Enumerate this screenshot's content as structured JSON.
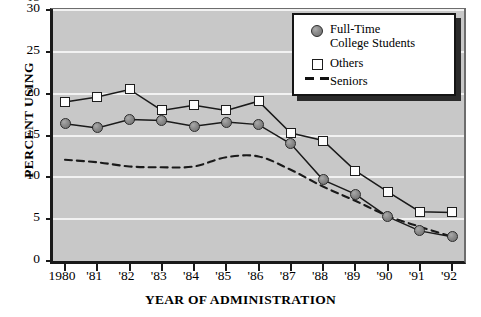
{
  "chart_data": {
    "type": "line",
    "title": "",
    "xlabel": "YEAR OF ADMINISTRATION",
    "ylabel": "PERCENT USING",
    "categories": [
      "1980",
      "'81",
      "'82",
      "'83",
      "'84",
      "'85",
      "'86",
      "'87",
      "'88",
      "'89",
      "'90",
      "'91",
      "'92"
    ],
    "x": [
      1980,
      1981,
      1982,
      1983,
      1984,
      1985,
      1986,
      1987,
      1988,
      1989,
      1990,
      1991,
      1992
    ],
    "ylim": [
      0,
      30
    ],
    "yticks": [
      0,
      5,
      10,
      15,
      20,
      25,
      30
    ],
    "yticklabels": [
      "0",
      "5",
      "10",
      "15",
      "20",
      "25",
      "30"
    ],
    "ytick_clipped_top": "35",
    "grid": "horizontal",
    "legend_position": "top-right",
    "series": [
      {
        "name": "Full-Time College Students",
        "marker": "filled-circle",
        "line": "solid",
        "color": "#7f7f7f",
        "values": [
          16.4,
          15.9,
          16.9,
          16.8,
          16.1,
          16.6,
          16.3,
          14.0,
          9.7,
          8.0,
          5.3,
          3.6,
          2.9
        ]
      },
      {
        "name": "Others",
        "marker": "open-square",
        "line": "solid",
        "color": "#ffffff",
        "values": [
          19.0,
          19.6,
          20.5,
          18.0,
          18.6,
          18.0,
          19.1,
          15.3,
          14.4,
          10.8,
          8.3,
          5.9,
          5.8
        ]
      },
      {
        "name": "Seniors",
        "marker": "none",
        "line": "dashed",
        "color": "#111111",
        "values": [
          12.1,
          11.8,
          11.3,
          11.2,
          11.3,
          12.4,
          12.5,
          10.9,
          8.9,
          7.2,
          5.4,
          4.1,
          2.9
        ]
      }
    ]
  },
  "legend": {
    "entries": [
      {
        "label_line1": "Full-Time",
        "label_line2": "College Students",
        "marker": "filled-circle-marker"
      },
      {
        "label_line1": "Others",
        "label_line2": "",
        "marker": "open-square-marker"
      },
      {
        "label_line1": "Seniors",
        "label_line2": "",
        "marker": "dashed-line-marker"
      }
    ]
  },
  "axes": {
    "y_title": "PERCENT USING",
    "x_title": "YEAR OF ADMINISTRATION"
  },
  "colors": {
    "plot_background": "#c8c8c8",
    "gridline": "#f2f2f2",
    "frame": "#1a1a1a",
    "circle_fill": "#8a8a8a",
    "square_fill": "#fdfdfd",
    "dash": "#111111"
  }
}
